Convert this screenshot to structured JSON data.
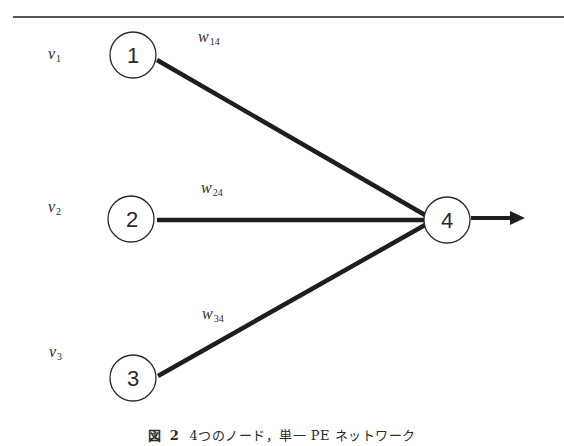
{
  "figure": {
    "caption_prefix": "図",
    "caption_number": "2",
    "caption_text": "4つのノード，単一 PE ネットワーク"
  },
  "nodes": [
    {
      "id": "1",
      "label": "1",
      "role": "input"
    },
    {
      "id": "2",
      "label": "2",
      "role": "input"
    },
    {
      "id": "3",
      "label": "3",
      "role": "input"
    },
    {
      "id": "4",
      "label": "4",
      "role": "output"
    }
  ],
  "inputs": [
    {
      "var": "v",
      "sub": "1"
    },
    {
      "var": "v",
      "sub": "2"
    },
    {
      "var": "v",
      "sub": "3"
    }
  ],
  "weights": [
    {
      "var": "w",
      "sub": "14",
      "from": "1",
      "to": "4"
    },
    {
      "var": "w",
      "sub": "24",
      "from": "2",
      "to": "4"
    },
    {
      "var": "w",
      "sub": "34",
      "from": "3",
      "to": "4"
    }
  ],
  "colors": {
    "stroke": "#2a2a2a",
    "edge": "#1e1e1e",
    "background": "#ffffff"
  }
}
